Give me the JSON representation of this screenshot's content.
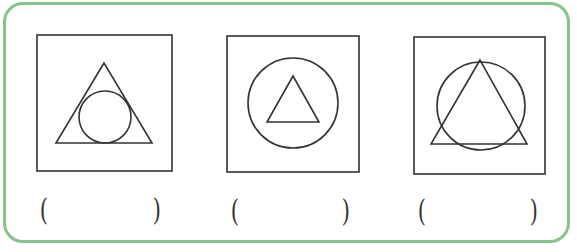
{
  "worksheet": {
    "border_color": "#86c489",
    "stroke_color": "#333333",
    "panels": [
      {
        "id": 1,
        "description": "circle inscribed in triangle, inside square",
        "box": {
          "x": 37,
          "y": 35,
          "w": 135,
          "h": 136
        },
        "triangle": {
          "apex": [
            104,
            63
          ],
          "base_left": [
            56,
            143
          ],
          "base_right": [
            152,
            143
          ]
        },
        "circle": {
          "cx": 105,
          "cy": 117,
          "r": 26
        },
        "answer_open": "(",
        "answer_close": ")",
        "answer_value": ""
      },
      {
        "id": 2,
        "description": "triangle inside circle, inside square",
        "box": {
          "x": 227,
          "y": 36,
          "w": 132,
          "h": 136
        },
        "triangle": {
          "apex": [
            293,
            76
          ],
          "base_left": [
            267,
            122
          ],
          "base_right": [
            319,
            122
          ]
        },
        "circle": {
          "cx": 293,
          "cy": 103,
          "r": 45
        },
        "answer_open": "(",
        "answer_close": ")",
        "answer_value": ""
      },
      {
        "id": 3,
        "description": "triangle and circle overlapping, inside square",
        "box": {
          "x": 414,
          "y": 37,
          "w": 131,
          "h": 137
        },
        "triangle": {
          "apex": [
            480,
            60
          ],
          "base_left": [
            431,
            144
          ],
          "base_right": [
            527,
            144
          ]
        },
        "circle": {
          "cx": 481,
          "cy": 106,
          "r": 44
        },
        "answer_open": "(",
        "answer_close": ")",
        "answer_value": ""
      }
    ]
  }
}
